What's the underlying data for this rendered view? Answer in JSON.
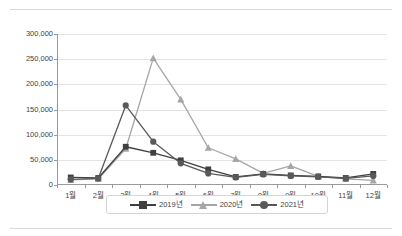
{
  "chart_data": {
    "type": "line",
    "title": "",
    "xlabel": "",
    "ylabel": "",
    "ylim": [
      0,
      300000
    ],
    "ytick_step": 50000,
    "grid": "horizontal",
    "legend_position": "bottom",
    "categories": [
      "1월",
      "2월",
      "3월",
      "4월",
      "5월",
      "6월",
      "7월",
      "8월",
      "9월",
      "10월",
      "11월",
      "12월"
    ],
    "ytick_labels": [
      "0",
      "50,000",
      "100,000",
      "150,000",
      "200,000",
      "250,000",
      "300,000"
    ],
    "ytick_values": [
      0,
      50000,
      100000,
      150000,
      200000,
      250000,
      300000
    ],
    "series": [
      {
        "name": "2019년",
        "color": "#404040",
        "marker": "square",
        "values": [
          15000,
          14000,
          76000,
          64000,
          49000,
          31000,
          16000,
          22000,
          19000,
          17000,
          14000,
          22000
        ]
      },
      {
        "name": "2020년",
        "color": "#a6a6a6",
        "marker": "triangle",
        "values": [
          10000,
          12000,
          72000,
          252000,
          170000,
          74000,
          52000,
          23000,
          38000,
          17000,
          12000,
          9000
        ]
      },
      {
        "name": "2021년",
        "color": "#595959",
        "marker": "circle",
        "values": [
          11000,
          13000,
          158000,
          86000,
          43000,
          23000,
          15000,
          21000,
          18000,
          16000,
          13000,
          18000
        ]
      }
    ]
  },
  "legend": {
    "items": [
      {
        "label": "2019년",
        "color": "#404040",
        "marker": "square"
      },
      {
        "label": "2020년",
        "color": "#a6a6a6",
        "marker": "triangle"
      },
      {
        "label": "2021년",
        "color": "#595959",
        "marker": "circle"
      }
    ]
  },
  "colors": {
    "gridline": "#e4e4e4",
    "axis": "#9a9a9a",
    "text": "#3f3f3f",
    "page_rule": "#d9d9d9",
    "background": "#ffffff"
  }
}
